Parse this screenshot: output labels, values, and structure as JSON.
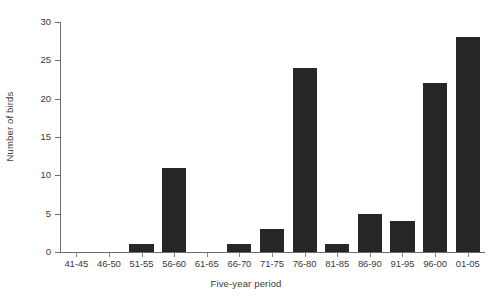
{
  "chart_data": {
    "type": "bar",
    "title": "",
    "xlabel": "Five-year period",
    "ylabel": "Number of birds",
    "categories": [
      "41-45",
      "46-50",
      "51-55",
      "56-60",
      "61-65",
      "66-70",
      "71-75",
      "76-80",
      "81-85",
      "86-90",
      "91-95",
      "96-00",
      "01-05"
    ],
    "values": [
      0,
      0,
      1,
      11,
      0,
      1,
      3,
      24,
      1,
      5,
      4,
      22,
      28
    ],
    "ylim": [
      0,
      30
    ],
    "yticks": [
      0,
      5,
      10,
      15,
      20,
      25,
      30
    ],
    "ytick_labels": [
      "0",
      "5",
      "10",
      "15",
      "20",
      "25",
      "30"
    ],
    "grid": false,
    "legend": null,
    "bar_color": "#262626",
    "axis_color": "#6e6e6e",
    "text_color": "#3a3a3a",
    "background": "#ffffff"
  }
}
